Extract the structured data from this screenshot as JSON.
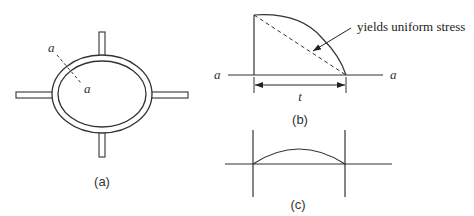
{
  "figure": {
    "panels": [
      {
        "id": "a",
        "caption": "(a)",
        "description": "Elliptical ring with four radial stubs; dashed section line a-a through ring wall",
        "labels": {
          "section_start": "a",
          "section_end": "a"
        }
      },
      {
        "id": "b",
        "caption": "(b)",
        "description": "Stress distribution across section a-a of thickness t",
        "labels": {
          "axis_left": "a",
          "axis_right": "a",
          "dimension": "t",
          "annotation": "yields uniform stress"
        }
      },
      {
        "id": "c",
        "caption": "(c)",
        "description": "Curved (parabolic) distribution between two vertical bounds"
      }
    ]
  },
  "colors": {
    "line": "#333333",
    "background": "#ffffff"
  }
}
